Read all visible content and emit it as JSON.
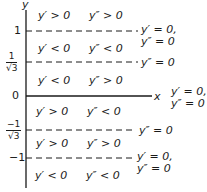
{
  "diagram": {
    "axes": {
      "y_label": "y",
      "x_label": "x"
    },
    "ticks": [
      {
        "label": "1"
      },
      {
        "num": "1",
        "den": "√3"
      },
      {
        "label": "0"
      },
      {
        "num": "−1",
        "den": "√3"
      },
      {
        "label": "−1"
      }
    ],
    "regions": [
      {
        "first": "y′ > 0",
        "second": "y″ > 0"
      },
      {
        "first": "y′ < 0",
        "second": "y″ < 0"
      },
      {
        "first": "y′ < 0",
        "second": "y″ > 0"
      },
      {
        "first": "y′ > 0",
        "second": "y″ < 0"
      },
      {
        "first": "y′ > 0",
        "second": "y″ > 0"
      },
      {
        "first": "y′ < 0",
        "second": "y″ < 0"
      }
    ],
    "line_labels": [
      {
        "line1": "y′ = 0,",
        "line2": "y″ = 0"
      },
      {
        "line1": "y″ = 0"
      },
      {
        "line1": "y′ = 0,",
        "line2": "y″ = 0"
      },
      {
        "line1": "y″ = 0"
      },
      {
        "line1": "y′ = 0,",
        "line2": "y″ = 0"
      }
    ]
  }
}
